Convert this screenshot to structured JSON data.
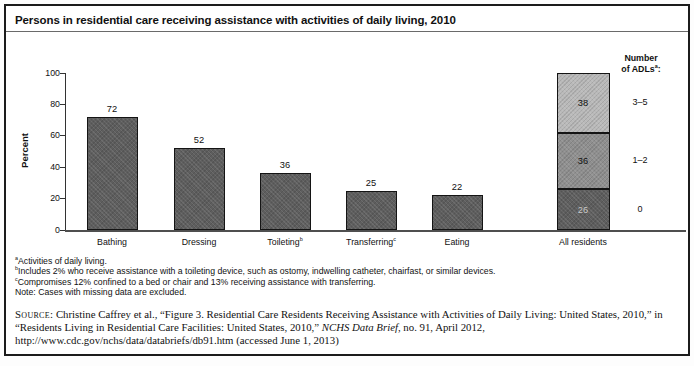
{
  "chart_data": {
    "type": "bar",
    "title": "Persons in residential care receiving assistance with activities of daily living, 2010",
    "xlabel": "",
    "ylabel": "Percent",
    "ylim": [
      0,
      100
    ],
    "yticks": [
      0,
      20,
      40,
      60,
      80,
      100
    ],
    "grid": false,
    "legend_position": "right-of-stacked-bar",
    "categories": [
      "Bathing",
      "Dressing",
      "Toileting",
      "Transferring",
      "Eating",
      "All residents"
    ],
    "bars": [
      {
        "category": "Bathing",
        "superscript": "",
        "value": 72
      },
      {
        "category": "Dressing",
        "superscript": "",
        "value": 52
      },
      {
        "category": "Toileting",
        "superscript": "b",
        "value": 36
      },
      {
        "category": "Transferring",
        "superscript": "c",
        "value": 25
      },
      {
        "category": "Eating",
        "superscript": "",
        "value": 22
      }
    ],
    "stacked_bar": {
      "category": "All residents",
      "superscript": "",
      "segments_bottom_to_top": [
        {
          "legend_label": "0",
          "value": 26,
          "color": "#5e5e5e",
          "value_color": "#c9c9c9"
        },
        {
          "legend_label": "1–2",
          "value": 36,
          "color": "#8f8f8f",
          "value_color": "#111111"
        },
        {
          "legend_label": "3–5",
          "value": 38,
          "color": "#b9b9b9",
          "value_color": "#111111"
        }
      ],
      "legend_title": {
        "line1": "Number",
        "line2": "of ADLs",
        "superscript": "a",
        "suffix": ":"
      }
    },
    "bar_color": "#5e5e5e",
    "value_label_color": "#111111"
  },
  "footnotes": [
    {
      "sup": "a",
      "text": "Activities of daily living."
    },
    {
      "sup": "b",
      "text": "Includes 2% who receive assistance with a toileting device, such as ostomy, indwelling catheter, chairfast, or similar devices."
    },
    {
      "sup": "c",
      "text": "Compromises 12% confined to a bed or chair and 13% receiving assistance with transferring."
    },
    {
      "sup": "",
      "text": "Note: Cases with missing data are excluded."
    }
  ],
  "source": {
    "label": "Source:",
    "before_italic": "Christine Caffrey et al., “Figure 3. Residential Care Residents Receiving Assistance with Activities of Daily Living: United States, 2010,” in “Residents Living in Residential Care Facilities: United States, 2010,”",
    "italic": "NCHS Data Brief",
    "after_italic": ", no. 91, April 2012, http://www.cdc.gov/nchs/data/databriefs/db91.htm (accessed June 1, 2013)"
  }
}
